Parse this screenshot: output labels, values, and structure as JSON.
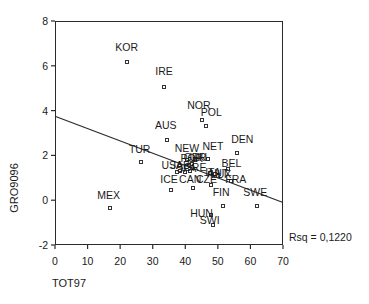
{
  "chart_data": {
    "type": "scatter",
    "title": "",
    "xlabel": "TOT97",
    "ylabel": "GRO9096",
    "xlim": [
      0,
      70
    ],
    "ylim": [
      -2,
      8
    ],
    "xticks": [
      "0",
      "10",
      "20",
      "30",
      "40",
      "50",
      "60",
      "70"
    ],
    "yticks": [
      "8",
      "6",
      "4",
      "2",
      "0",
      "-2"
    ],
    "grid": false,
    "legend": null,
    "annotation": "Rsq = 0,1220",
    "rsq": 0.122,
    "marker": "open-square",
    "marker_color": "#333333",
    "line_color": "#2b2b2b",
    "fit_line": {
      "type": "linear-regression",
      "x_start": 0,
      "y_start": 3.75,
      "x_end": 70,
      "y_end": -0.1
    },
    "points": [
      {
        "label": "KOR",
        "x": 22.0,
        "y": 6.15,
        "lx": 22.0,
        "ly": 6.85
      },
      {
        "label": "IRE",
        "x": 33.5,
        "y": 5.05,
        "lx": 33.5,
        "ly": 5.75
      },
      {
        "label": "NOR",
        "x": 45.0,
        "y": 3.6,
        "lx": 44.2,
        "ly": 4.25
      },
      {
        "label": "POL",
        "x": 46.5,
        "y": 3.3,
        "lx": 48.0,
        "ly": 3.95
      },
      {
        "label": "AUS",
        "x": 34.5,
        "y": 2.7,
        "lx": 34.0,
        "ly": 3.35
      },
      {
        "label": "DEN",
        "x": 56.0,
        "y": 2.1,
        "lx": 57.5,
        "ly": 2.75
      },
      {
        "label": "NET",
        "x": 47.0,
        "y": 1.85,
        "lx": 48.5,
        "ly": 2.4
      },
      {
        "label": "NEW",
        "x": 40.5,
        "y": 1.8,
        "lx": 40.5,
        "ly": 2.35
      },
      {
        "label": "TUR",
        "x": 26.5,
        "y": 1.7,
        "lx": 26.0,
        "ly": 2.3
      },
      {
        "label": "UKI",
        "x": 43.0,
        "y": 1.8,
        "lx": 44.0,
        "ly": 1.95
      },
      {
        "label": "GER",
        "x": 42.0,
        "y": 1.6,
        "lx": 43.0,
        "ly": 1.95
      },
      {
        "label": "POR",
        "x": 41.0,
        "y": 1.55,
        "lx": 42.0,
        "ly": 1.9
      },
      {
        "label": "USA",
        "x": 37.5,
        "y": 1.25,
        "lx": 36.0,
        "ly": 1.55
      },
      {
        "label": "JAP",
        "x": 38.5,
        "y": 1.3,
        "lx": 38.5,
        "ly": 1.55
      },
      {
        "label": "SPA",
        "x": 40.0,
        "y": 1.25,
        "lx": 40.3,
        "ly": 1.45
      },
      {
        "label": "GRE",
        "x": 41.5,
        "y": 1.3,
        "lx": 43.0,
        "ly": 1.5
      },
      {
        "label": "BEL",
        "x": 53.0,
        "y": 1.4,
        "lx": 54.2,
        "ly": 1.65
      },
      {
        "label": "ITA",
        "x": 47.5,
        "y": 1.2,
        "lx": 48.5,
        "ly": 1.25
      },
      {
        "label": "AUT",
        "x": 49.0,
        "y": 1.15,
        "lx": 50.0,
        "ly": 1.2
      },
      {
        "label": "LUX",
        "x": 50.0,
        "y": 1.1,
        "lx": 51.0,
        "ly": 1.15
      },
      {
        "label": "FRA",
        "x": 54.0,
        "y": 0.85,
        "lx": 55.5,
        "ly": 0.95
      },
      {
        "label": "CAN",
        "x": 42.5,
        "y": 0.55,
        "lx": 41.5,
        "ly": 0.95
      },
      {
        "label": "ICE",
        "x": 35.5,
        "y": 0.45,
        "lx": 35.0,
        "ly": 0.95
      },
      {
        "label": "CZE",
        "x": 48.0,
        "y": 0.7,
        "lx": 46.5,
        "ly": 0.95
      },
      {
        "label": "FIN",
        "x": 51.5,
        "y": -0.25,
        "lx": 51.0,
        "ly": 0.35
      },
      {
        "label": "SWE",
        "x": 62.0,
        "y": -0.25,
        "lx": 61.5,
        "ly": 0.35
      },
      {
        "label": "MEX",
        "x": 17.0,
        "y": -0.35,
        "lx": 16.5,
        "ly": 0.25
      },
      {
        "label": "HUN",
        "x": 48.0,
        "y": -0.65,
        "lx": 45.0,
        "ly": -0.55
      },
      {
        "label": "SWI",
        "x": 48.5,
        "y": -1.1,
        "lx": 47.5,
        "ly": -0.9
      }
    ]
  }
}
